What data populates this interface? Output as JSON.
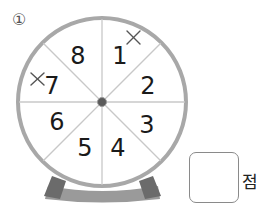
{
  "problem": {
    "number_label": "①"
  },
  "wheel": {
    "sectors": [
      {
        "label": "1",
        "marked": true
      },
      {
        "label": "2",
        "marked": false
      },
      {
        "label": "3",
        "marked": false
      },
      {
        "label": "4",
        "marked": false
      },
      {
        "label": "5",
        "marked": false
      },
      {
        "label": "6",
        "marked": false
      },
      {
        "label": "7",
        "marked": true
      },
      {
        "label": "8",
        "marked": false
      }
    ],
    "mark_symbol": "×",
    "colors": {
      "rim": "#a8a8a8",
      "divider": "#c8c8c8",
      "hub": "#5a5a5a",
      "leg": "#6b6b6b",
      "base": "#9a9a9a"
    }
  },
  "answer": {
    "value": "",
    "unit": "점"
  }
}
